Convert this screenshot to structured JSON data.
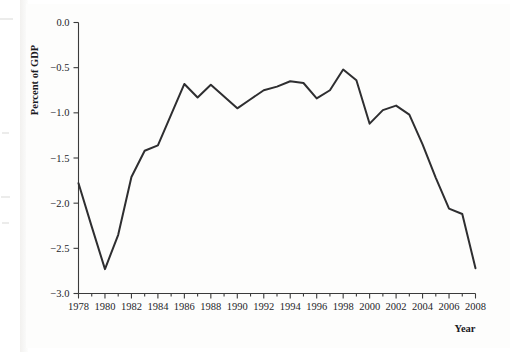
{
  "figure": {
    "y_axis_title": "Percent of GDP",
    "x_axis_title": "Year"
  },
  "chart_data": {
    "type": "line",
    "title": "",
    "subtitle": "",
    "xlabel": "Year",
    "ylabel": "Percent of GDP",
    "xlim": [
      1978,
      2008
    ],
    "ylim": [
      -3.0,
      0.0
    ],
    "grid": false,
    "legend": null,
    "x_tick_labels": [
      "1978",
      "1980",
      "1982",
      "1984",
      "1986",
      "1988",
      "1990",
      "1992",
      "1994",
      "1996",
      "1998",
      "2000",
      "2002",
      "2004",
      "2006",
      "2008"
    ],
    "x_tick_values": [
      1978,
      1980,
      1982,
      1984,
      1986,
      1988,
      1990,
      1992,
      1994,
      1996,
      1998,
      2000,
      2002,
      2004,
      2006,
      2008
    ],
    "x_minor_tick_values": [
      1979,
      1981,
      1983,
      1985,
      1987,
      1989,
      1991,
      1993,
      1995,
      1997,
      1999,
      2001,
      2003,
      2005,
      2007
    ],
    "y_tick_labels": [
      "0.0",
      "−0.5",
      "−1.0",
      "−1.5",
      "−2.0",
      "−2.5",
      "−3.0"
    ],
    "y_tick_values": [
      0.0,
      -0.5,
      -1.0,
      -1.5,
      -2.0,
      -2.5,
      -3.0
    ],
    "line_color": "#2e2e30",
    "x": [
      1978,
      1979,
      1980,
      1981,
      1982,
      1983,
      1984,
      1985,
      1986,
      1987,
      1988,
      1989,
      1990,
      1991,
      1992,
      1993,
      1994,
      1995,
      1996,
      1997,
      1998,
      1999,
      2000,
      2001,
      2002,
      2003,
      2004,
      2005,
      2006,
      2007,
      2008
    ],
    "values": [
      -1.78,
      -2.26,
      -2.73,
      -2.35,
      -1.71,
      -1.42,
      -1.36,
      -1.02,
      -0.68,
      -0.83,
      -0.69,
      -0.82,
      -0.95,
      -0.85,
      -0.75,
      -0.71,
      -0.65,
      -0.67,
      -0.84,
      -0.75,
      -0.52,
      -0.64,
      -1.12,
      -0.97,
      -0.92,
      -1.02,
      -1.35,
      -1.72,
      -2.06,
      -2.12,
      -2.72
    ]
  }
}
